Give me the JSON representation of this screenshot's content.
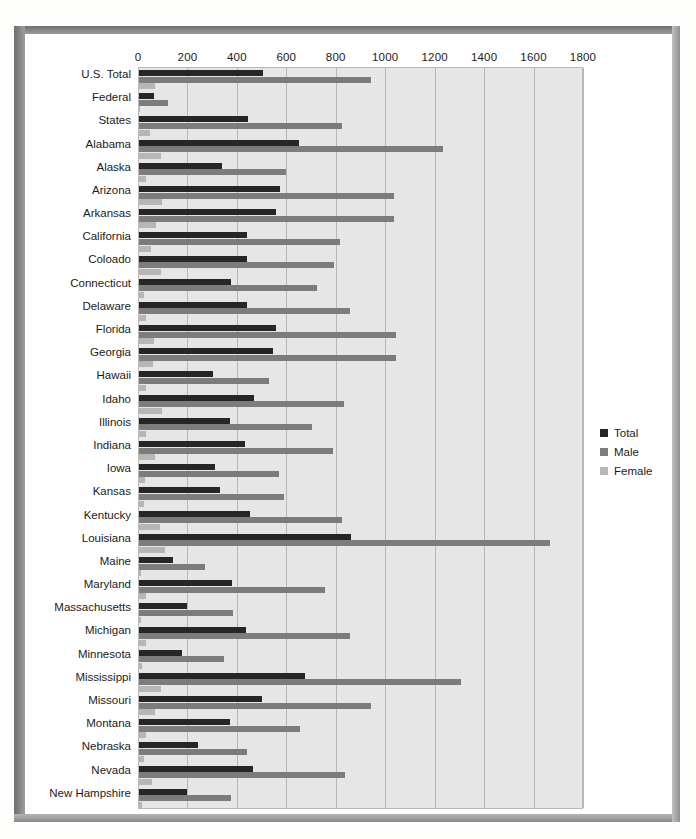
{
  "chart_data": {
    "type": "bar",
    "orientation": "horizontal",
    "title": "",
    "xlabel": "",
    "ylabel": "",
    "xlim": [
      0,
      1800
    ],
    "xticks": [
      0,
      200,
      400,
      600,
      800,
      1000,
      1200,
      1400,
      1600,
      1800
    ],
    "grid": true,
    "legend_position": "right",
    "legend": [
      "Total",
      "Male",
      "Female"
    ],
    "colors": {
      "total": "#262626",
      "male": "#7c7c7c",
      "female": "#b6b6b6",
      "plot_background": "#e6e6e6",
      "gridline": "#b6b6b6",
      "text": "#1b1b1b"
    },
    "categories": [
      "U.S. Total",
      "Federal",
      "States",
      "Alabama",
      "Alaska",
      "Arizona",
      "Arkansas",
      "California",
      "Coloado",
      "Connecticut",
      "Delaware",
      "Florida",
      "Georgia",
      "Hawaii",
      "Idaho",
      "Illinois",
      "Indiana",
      "Iowa",
      "Kansas",
      "Kentucky",
      "Louisiana",
      "Maine",
      "Maryland",
      "Massachusetts",
      "Michigan",
      "Minnesota",
      "Mississippi",
      "Missouri",
      "Montana",
      "Nebraska",
      "Nevada",
      "New Hampshire"
    ],
    "series": [
      {
        "name": "Total",
        "values": [
          500,
          60,
          440,
          649,
          337,
          570,
          553,
          436,
          436,
          373,
          436,
          553,
          540,
          300,
          467,
          367,
          427,
          307,
          327,
          447,
          857,
          137,
          377,
          193,
          433,
          173,
          673,
          497,
          367,
          240,
          460,
          193
        ]
      },
      {
        "name": "Male",
        "values": [
          940,
          116,
          820,
          1231,
          596,
          1033,
          1033,
          813,
          790,
          720,
          853,
          1040,
          1040,
          527,
          831,
          700,
          784,
          567,
          587,
          820,
          1663,
          267,
          751,
          380,
          853,
          344,
          1304,
          940,
          653,
          437,
          833,
          373
        ]
      },
      {
        "name": "Female",
        "values": [
          63,
          4,
          44,
          87,
          27,
          93,
          70,
          50,
          87,
          20,
          27,
          60,
          57,
          29,
          93,
          27,
          64,
          24,
          20,
          84,
          107,
          7,
          27,
          7,
          27,
          13,
          87,
          63,
          27,
          20,
          53,
          13
        ]
      }
    ]
  },
  "legend": {
    "items": [
      {
        "label": "Total",
        "color": "#262626"
      },
      {
        "label": "Male",
        "color": "#7c7c7c"
      },
      {
        "label": "Female",
        "color": "#b6b6b6"
      }
    ]
  }
}
